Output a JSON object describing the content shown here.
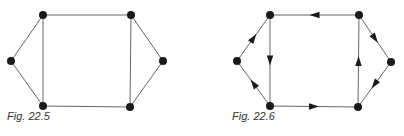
{
  "figures": [
    {
      "caption": "Fig. 22.5",
      "caption_pos": [
        7,
        116
      ],
      "directed": false,
      "nodes": [
        {
          "id": "TL",
          "x": 43,
          "y": 15
        },
        {
          "id": "TR",
          "x": 131,
          "y": 15
        },
        {
          "id": "L",
          "x": 11,
          "y": 61
        },
        {
          "id": "R",
          "x": 163,
          "y": 61
        },
        {
          "id": "BL",
          "x": 43,
          "y": 106
        },
        {
          "id": "BR",
          "x": 130,
          "y": 107
        }
      ],
      "edges": [
        [
          "TL",
          "TR"
        ],
        [
          "TL",
          "BL"
        ],
        [
          "L",
          "TL"
        ],
        [
          "L",
          "BL"
        ],
        [
          "BL",
          "BR"
        ],
        [
          "TR",
          "BR"
        ],
        [
          "TR",
          "R"
        ],
        [
          "R",
          "BR"
        ]
      ]
    },
    {
      "caption": "Fig. 22.6",
      "caption_pos": [
        232,
        116
      ],
      "directed": true,
      "nodes": [
        {
          "id": "TL",
          "x": 270,
          "y": 15
        },
        {
          "id": "TR",
          "x": 359,
          "y": 15
        },
        {
          "id": "L",
          "x": 237,
          "y": 61
        },
        {
          "id": "R",
          "x": 391,
          "y": 62
        },
        {
          "id": "BL",
          "x": 270,
          "y": 106
        },
        {
          "id": "BR",
          "x": 358,
          "y": 107
        }
      ],
      "edges": [
        [
          "TR",
          "TL"
        ],
        [
          "TL",
          "BL"
        ],
        [
          "L",
          "TL"
        ],
        [
          "BL",
          "L"
        ],
        [
          "BL",
          "BR"
        ],
        [
          "BR",
          "TR"
        ],
        [
          "TR",
          "R"
        ],
        [
          "R",
          "BR"
        ]
      ]
    }
  ],
  "style": {
    "edge_color": "#666666",
    "node_color": "#1a1a1a",
    "arrow_color": "#1a1a1a"
  }
}
